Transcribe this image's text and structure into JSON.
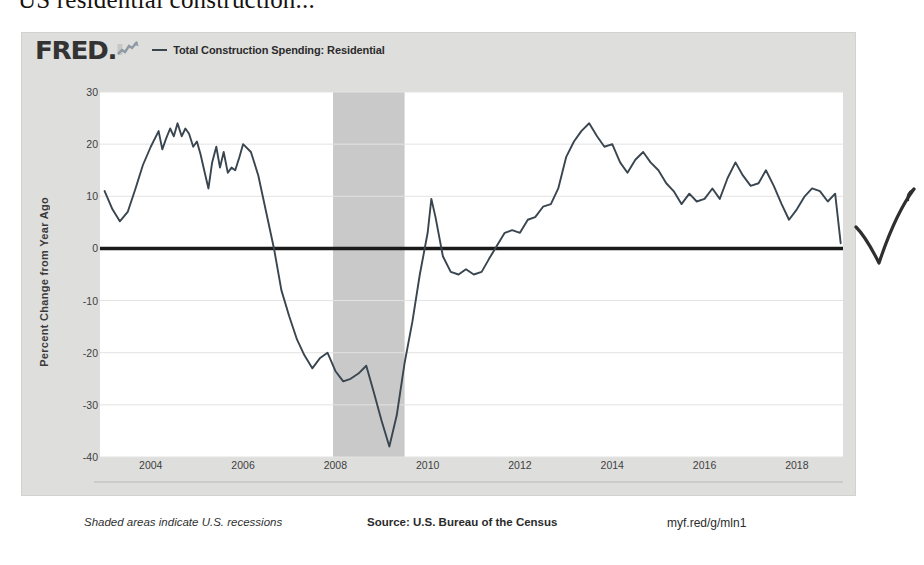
{
  "page": {
    "heading": "US residential construction..."
  },
  "fred": {
    "logo_text": "FRED",
    "logo_dot": ".",
    "sparkline_icon": "sparkline-icon",
    "legend": {
      "dash": "—",
      "series_label": "Total Construction Spending: Residential",
      "series_color": "#39454f"
    },
    "footer": {
      "recessions_note": "Shaded areas indicate U.S. recessions",
      "source": "Source: U.S. Bureau of the Census",
      "permalink": "myf.red/g/mln1"
    },
    "colors": {
      "card_background": "#dededd",
      "plot_background": "#ffffff",
      "recession_shading": "#c9c9c9",
      "gridline": "#e3e3e3",
      "zero_line": "#1a1a1a",
      "series": "#39454f"
    }
  },
  "annotations": [
    {
      "name": "check-mark",
      "kind": "handwritten-check",
      "color": "#2b2b2b"
    }
  ],
  "chart_data": {
    "type": "line",
    "title": "Total Construction Spending: Residential",
    "xlabel": "",
    "ylabel": "Percent Change from Year Ago",
    "ylim": [
      -40,
      30
    ],
    "xlim": [
      2002.9,
      2019.0
    ],
    "grid": true,
    "legend_position": "top-left",
    "y_ticks": [
      30,
      20,
      10,
      0,
      -10,
      -20,
      -30,
      -40
    ],
    "y_tick_labels": [
      "30",
      "20",
      "10",
      "0",
      "-10",
      "-20",
      "-30",
      "-40"
    ],
    "x_ticks": [
      2004,
      2006,
      2008,
      2010,
      2012,
      2014,
      2016,
      2018
    ],
    "x_tick_labels": [
      "2004",
      "2006",
      "2008",
      "2010",
      "2012",
      "2014",
      "2016",
      "2018"
    ],
    "zero_line": 0,
    "recession_bands": [
      {
        "start": 2007.95,
        "end": 2009.5,
        "label": "U.S. recession"
      }
    ],
    "series": [
      {
        "name": "Total Construction Spending: Residential",
        "color": "#39454f",
        "units": "Percent Change from Year Ago",
        "x": [
          2003.0,
          2003.17,
          2003.33,
          2003.5,
          2003.67,
          2003.83,
          2004.0,
          2004.17,
          2004.25,
          2004.33,
          2004.42,
          2004.5,
          2004.58,
          2004.67,
          2004.75,
          2004.83,
          2004.92,
          2005.0,
          2005.08,
          2005.17,
          2005.25,
          2005.33,
          2005.42,
          2005.5,
          2005.58,
          2005.67,
          2005.75,
          2005.83,
          2005.92,
          2006.0,
          2006.17,
          2006.33,
          2006.5,
          2006.67,
          2006.83,
          2007.0,
          2007.17,
          2007.33,
          2007.5,
          2007.67,
          2007.83,
          2008.0,
          2008.17,
          2008.33,
          2008.5,
          2008.67,
          2008.83,
          2009.0,
          2009.17,
          2009.33,
          2009.5,
          2009.67,
          2009.83,
          2010.0,
          2010.08,
          2010.17,
          2010.33,
          2010.5,
          2010.67,
          2010.83,
          2011.0,
          2011.17,
          2011.33,
          2011.5,
          2011.67,
          2011.83,
          2012.0,
          2012.17,
          2012.33,
          2012.5,
          2012.67,
          2012.83,
          2013.0,
          2013.17,
          2013.33,
          2013.5,
          2013.67,
          2013.83,
          2014.0,
          2014.17,
          2014.33,
          2014.5,
          2014.67,
          2014.83,
          2015.0,
          2015.17,
          2015.33,
          2015.5,
          2015.67,
          2015.83,
          2016.0,
          2016.17,
          2016.33,
          2016.5,
          2016.67,
          2016.83,
          2017.0,
          2017.17,
          2017.33,
          2017.5,
          2017.67,
          2017.83,
          2018.0,
          2018.17,
          2018.33,
          2018.5,
          2018.67,
          2018.83,
          2018.95
        ],
        "y": [
          11.0,
          7.5,
          5.2,
          7.0,
          11.5,
          16.0,
          19.5,
          22.5,
          19.0,
          21.0,
          23.0,
          21.5,
          24.0,
          21.5,
          23.0,
          22.0,
          19.5,
          20.5,
          18.0,
          14.5,
          11.5,
          16.5,
          19.5,
          15.5,
          18.5,
          14.5,
          15.5,
          15.0,
          17.5,
          20.0,
          18.5,
          14.0,
          7.0,
          0.0,
          -8.0,
          -13.0,
          -17.5,
          -20.5,
          -23.0,
          -21.0,
          -20.0,
          -23.5,
          -25.5,
          -25.0,
          -24.0,
          -22.5,
          -27.5,
          -33.0,
          -38.0,
          -32.0,
          -22.0,
          -14.0,
          -5.0,
          3.0,
          9.5,
          6.0,
          -1.5,
          -4.5,
          -5.0,
          -4.0,
          -5.0,
          -4.5,
          -2.0,
          0.5,
          3.0,
          3.5,
          3.0,
          5.5,
          6.0,
          8.0,
          8.5,
          11.5,
          17.5,
          20.5,
          22.5,
          24.0,
          21.5,
          19.5,
          20.0,
          16.5,
          14.5,
          17.0,
          18.5,
          16.5,
          15.0,
          12.5,
          11.0,
          8.5,
          10.5,
          9.0,
          9.5,
          11.5,
          9.5,
          13.5,
          16.5,
          14.0,
          12.0,
          12.5,
          15.0,
          12.0,
          8.5,
          5.5,
          7.5,
          10.0,
          11.5,
          11.0,
          9.0,
          10.5,
          1.0
        ]
      }
    ]
  }
}
